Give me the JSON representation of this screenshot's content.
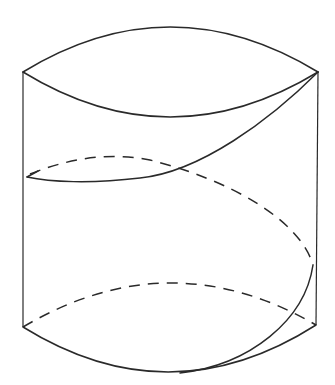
{
  "diagram": {
    "title": "",
    "colors": {
      "stroke": "#2a2a2a",
      "background": "#ffffff"
    },
    "elements": [
      {
        "id": "top-ellipse-front",
        "style": "solid"
      },
      {
        "id": "top-ellipse-back",
        "style": "solid"
      },
      {
        "id": "left-edge",
        "style": "solid"
      },
      {
        "id": "right-edge",
        "style": "solid"
      },
      {
        "id": "helix-front-upper",
        "style": "solid"
      },
      {
        "id": "helix-back",
        "style": "dashed"
      },
      {
        "id": "helix-front-lower",
        "style": "solid"
      },
      {
        "id": "bottom-ellipse-front",
        "style": "solid"
      },
      {
        "id": "bottom-ellipse-back",
        "style": "dashed"
      }
    ]
  }
}
